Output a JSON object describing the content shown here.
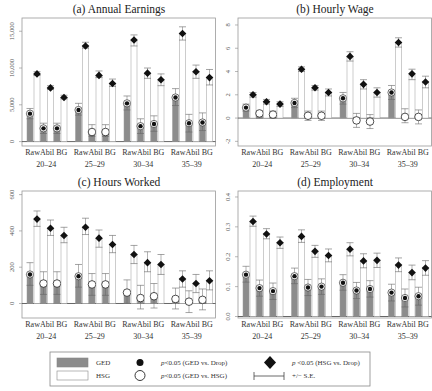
{
  "chart_data": [
    {
      "type": "bar",
      "title": "(a) Annual Earnings",
      "ylabel": "",
      "yticks": [
        0,
        5000,
        10000,
        15000
      ],
      "ytick_labels": [
        "0",
        "5,000",
        "10,000",
        "15,000"
      ],
      "ylim": [
        -600,
        16800
      ],
      "age_groups": [
        "20-24",
        "25-29",
        "30-34",
        "35-39"
      ],
      "measures": [
        "Raw",
        "Abil",
        "BG"
      ],
      "series": [
        {
          "name": "GED",
          "values": [
            [
              3800,
              1800,
              1800
            ],
            [
              4300,
              1300,
              1300
            ],
            [
              5200,
              2100,
              2400
            ],
            [
              6000,
              2500,
              2600
            ]
          ],
          "se_low": [
            [
              3100,
              1100,
              1100
            ],
            [
              3600,
              700,
              700
            ],
            [
              4300,
              1100,
              1400
            ],
            [
              4900,
              1300,
              1500
            ]
          ],
          "se_high": [
            [
              4500,
              2500,
              2500
            ],
            [
              5200,
              2300,
              2300
            ],
            [
              6200,
              3100,
              3500
            ],
            [
              7200,
              3700,
              3900
            ]
          ],
          "marker": [
            [
              "dot",
              "dot",
              "dot"
            ],
            [
              "dot",
              "circle",
              "circle"
            ],
            [
              "dot",
              "dot",
              "dot"
            ],
            [
              "dot",
              "dot",
              "dot"
            ]
          ]
        },
        {
          "name": "HSG",
          "values": [
            [
              9200,
              7300,
              6000
            ],
            [
              13000,
              9000,
              7900
            ],
            [
              13800,
              9300,
              8400
            ],
            [
              14700,
              9500,
              8700
            ]
          ],
          "se_low": [
            [
              9000,
              7100,
              5800
            ],
            [
              12700,
              8700,
              7500
            ],
            [
              13000,
              8600,
              7600
            ],
            [
              13800,
              8600,
              7700
            ]
          ],
          "se_high": [
            [
              9500,
              7600,
              6300
            ],
            [
              13500,
              9600,
              8500
            ],
            [
              14500,
              10000,
              9200
            ],
            [
              15600,
              10400,
              9800
            ]
          ],
          "marker": [
            [
              "diamond",
              "diamond",
              "diamond"
            ],
            [
              "diamond",
              "diamond",
              "diamond"
            ],
            [
              "diamond",
              "diamond",
              "diamond"
            ],
            [
              "diamond",
              "diamond",
              "diamond"
            ]
          ]
        }
      ]
    },
    {
      "type": "bar",
      "title": "(b) Hourly Wage",
      "ylabel": "",
      "yticks": [
        -2,
        0,
        2,
        4,
        6,
        8
      ],
      "ytick_labels": [
        "-2",
        "0",
        "2",
        "4",
        "6",
        "8"
      ],
      "ylim": [
        -2.4,
        8.6
      ],
      "age_groups": [
        "20-24",
        "25-29",
        "30-34",
        "35-39"
      ],
      "measures": [
        "Raw",
        "Abil",
        "BG"
      ],
      "series": [
        {
          "name": "GED",
          "values": [
            [
              0.9,
              0.4,
              0.3
            ],
            [
              1.3,
              0.2,
              0.2
            ],
            [
              1.7,
              -0.2,
              -0.3
            ],
            [
              2.2,
              0.1,
              0.1
            ]
          ],
          "se_low": [
            [
              0.6,
              0.0,
              0.0
            ],
            [
              0.9,
              -0.2,
              -0.2
            ],
            [
              1.2,
              -0.8,
              -0.9
            ],
            [
              1.6,
              -0.4,
              -0.5
            ]
          ],
          "se_high": [
            [
              1.2,
              0.6,
              0.6
            ],
            [
              1.7,
              0.6,
              0.6
            ],
            [
              2.2,
              0.4,
              0.3
            ],
            [
              2.8,
              0.8,
              0.7
            ]
          ],
          "marker": [
            [
              "dot",
              "circle",
              "circle"
            ],
            [
              "dot",
              "circle",
              "circle"
            ],
            [
              "dot",
              "circle",
              "circle"
            ],
            [
              "dot",
              "circle",
              "circle"
            ]
          ]
        },
        {
          "name": "HSG",
          "values": [
            [
              2.0,
              1.4,
              1.2
            ],
            [
              4.2,
              2.6,
              2.2
            ],
            [
              5.3,
              2.9,
              2.2
            ],
            [
              6.5,
              3.8,
              3.1
            ]
          ],
          "se_low": [
            [
              1.8,
              1.2,
              1.0
            ],
            [
              4.0,
              2.4,
              1.9
            ],
            [
              4.9,
              2.5,
              1.8
            ],
            [
              6.1,
              3.3,
              2.6
            ]
          ],
          "se_high": [
            [
              2.2,
              1.6,
              1.4
            ],
            [
              4.4,
              2.8,
              2.5
            ],
            [
              5.7,
              3.3,
              2.6
            ],
            [
              6.9,
              4.2,
              3.6
            ]
          ],
          "marker": [
            [
              "diamond",
              "diamond",
              "diamond"
            ],
            [
              "diamond",
              "diamond",
              "diamond"
            ],
            [
              "diamond",
              "diamond",
              "diamond"
            ],
            [
              "diamond",
              "diamond",
              "diamond"
            ]
          ]
        }
      ]
    },
    {
      "type": "bar",
      "title": "(c) Hours Worked",
      "ylabel": "",
      "yticks": [
        0,
        200,
        400,
        600
      ],
      "ytick_labels": [
        "0",
        "200",
        "400",
        "600"
      ],
      "ylim": [
        -80,
        620
      ],
      "age_groups": [
        "20-24",
        "25-29",
        "30-34",
        "35-39"
      ],
      "measures": [
        "Raw",
        "Abil",
        "BG"
      ],
      "series": [
        {
          "name": "GED",
          "values": [
            [
              160,
              110,
              110
            ],
            [
              150,
              105,
              105
            ],
            [
              60,
              30,
              40
            ],
            [
              25,
              10,
              20
            ]
          ],
          "se_low": [
            [
              100,
              50,
              50
            ],
            [
              90,
              45,
              45
            ],
            [
              0,
              -30,
              -25
            ],
            [
              -30,
              -50,
              -35
            ]
          ],
          "se_high": [
            [
              225,
              175,
              175
            ],
            [
              215,
              165,
              165
            ],
            [
              130,
              100,
              110
            ],
            [
              85,
              70,
              80
            ]
          ],
          "marker": [
            [
              "dot",
              "circle",
              "circle"
            ],
            [
              "dot",
              "circle",
              "circle"
            ],
            [
              "circle",
              "circle",
              "circle"
            ],
            [
              "circle",
              "circle",
              "circle"
            ]
          ]
        },
        {
          "name": "HSG",
          "values": [
            [
              465,
              415,
              375
            ],
            [
              420,
              360,
              325
            ],
            [
              270,
              225,
              215
            ],
            [
              135,
              110,
              125
            ]
          ],
          "se_low": [
            [
              425,
              375,
              335
            ],
            [
              380,
              310,
              280
            ],
            [
              220,
              175,
              160
            ],
            [
              90,
              60,
              75
            ]
          ],
          "se_high": [
            [
              510,
              460,
              420
            ],
            [
              470,
              405,
              375
            ],
            [
              320,
              285,
              270
            ],
            [
              180,
              160,
              180
            ]
          ],
          "marker": [
            [
              "diamond",
              "diamond",
              "diamond"
            ],
            [
              "diamond",
              "diamond",
              "diamond"
            ],
            [
              "diamond",
              "diamond",
              "diamond"
            ],
            [
              "diamond",
              "diamond",
              "diamond"
            ]
          ]
        }
      ]
    },
    {
      "type": "bar",
      "title": "(d) Employment",
      "ylabel": "",
      "yticks": [
        0.0,
        0.1,
        0.2,
        0.3,
        0.4
      ],
      "ytick_labels": [
        "0.0",
        "0.1",
        "0.2",
        "0.3",
        "0.4"
      ],
      "ylim": [
        -0.005,
        0.42
      ],
      "age_groups": [
        "20-24",
        "25-29",
        "30-34",
        "35-39"
      ],
      "measures": [
        "Raw",
        "Abil",
        "BG"
      ],
      "series": [
        {
          "name": "GED",
          "values": [
            [
              0.14,
              0.095,
              0.085
            ],
            [
              0.135,
              0.097,
              0.1
            ],
            [
              0.113,
              0.087,
              0.092
            ],
            [
              0.08,
              0.062,
              0.068
            ]
          ],
          "se_low": [
            [
              0.115,
              0.068,
              0.057
            ],
            [
              0.11,
              0.07,
              0.074
            ],
            [
              0.088,
              0.06,
              0.065
            ],
            [
              0.052,
              0.032,
              0.038
            ]
          ],
          "se_high": [
            [
              0.168,
              0.122,
              0.112
            ],
            [
              0.162,
              0.124,
              0.126
            ],
            [
              0.14,
              0.114,
              0.12
            ],
            [
              0.108,
              0.092,
              0.098
            ]
          ],
          "marker": [
            [
              "dot",
              "dot",
              "dot"
            ],
            [
              "dot",
              "dot",
              "dot"
            ],
            [
              "dot",
              "dot",
              "dot"
            ],
            [
              "dot",
              "dot",
              "dot"
            ]
          ]
        },
        {
          "name": "HSG",
          "values": [
            [
              0.318,
              0.276,
              0.247
            ],
            [
              0.268,
              0.218,
              0.204
            ],
            [
              0.225,
              0.186,
              0.188
            ],
            [
              0.172,
              0.147,
              0.162
            ]
          ],
          "se_low": [
            [
              0.302,
              0.26,
              0.228
            ],
            [
              0.248,
              0.198,
              0.183
            ],
            [
              0.203,
              0.163,
              0.164
            ],
            [
              0.15,
              0.123,
              0.138
            ]
          ],
          "se_high": [
            [
              0.336,
              0.294,
              0.266
            ],
            [
              0.29,
              0.238,
              0.226
            ],
            [
              0.247,
              0.21,
              0.212
            ],
            [
              0.196,
              0.172,
              0.187
            ]
          ],
          "marker": [
            [
              "diamond",
              "diamond",
              "diamond"
            ],
            [
              "diamond",
              "diamond",
              "diamond"
            ],
            [
              "diamond",
              "diamond",
              "diamond"
            ],
            [
              "diamond",
              "diamond",
              "diamond"
            ]
          ]
        }
      ]
    }
  ],
  "panels_layout": [
    {
      "x0": 22,
      "x1": 216,
      "ytop": 18,
      "ybot": 146,
      "title_y": 13,
      "ticklabel_x": 11
    },
    {
      "x0": 238,
      "x1": 432,
      "ytop": 18,
      "ybot": 146,
      "title_y": 13,
      "ticklabel_x": 227
    },
    {
      "x0": 22,
      "x1": 216,
      "ytop": 191,
      "ybot": 318,
      "title_y": 186,
      "ticklabel_x": 11
    },
    {
      "x0": 238,
      "x1": 432,
      "ytop": 191,
      "ybot": 318,
      "title_y": 186,
      "ticklabel_x": 227
    }
  ],
  "x_group_label": "RawAbil BG",
  "age_labels": [
    "20–24",
    "25–29",
    "30–34",
    "35–39"
  ],
  "colors": {
    "ged_fill": "#8c8c8c",
    "hsg_fill": "#ffffff",
    "bar_stroke": "#9a9a9a",
    "frame": "#9a9a9a",
    "marker": "#111111"
  },
  "legend": {
    "ged_label": "GED",
    "hsg_label": "HSG",
    "dot_label": "p<0.05 (GED vs. Drop)",
    "circle_label": "p<0.05 (GED vs. HSG)",
    "diamond_label": "p <0.05 (HSG vs. Drop)",
    "se_label": "+/− S.E."
  }
}
